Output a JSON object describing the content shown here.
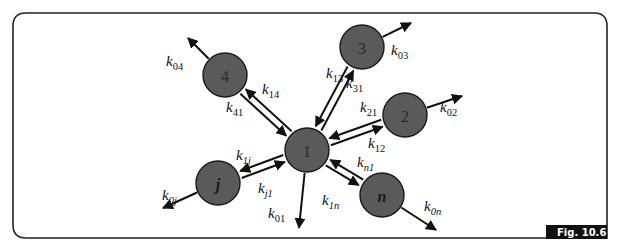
{
  "figure": {
    "label": "Fig. 10.6",
    "type": "compartmental model diagram"
  },
  "nodes": [
    {
      "id": "1",
      "label": "1",
      "italic": false
    },
    {
      "id": "2",
      "label": "2",
      "italic": false
    },
    {
      "id": "3",
      "label": "3",
      "italic": false
    },
    {
      "id": "4",
      "label": "4",
      "italic": false
    },
    {
      "id": "j",
      "label": "j",
      "italic": true
    },
    {
      "id": "n",
      "label": "n",
      "italic": true
    }
  ],
  "edges": [
    {
      "from": "1",
      "to": "2",
      "label": "k",
      "sub": "21"
    },
    {
      "from": "2",
      "to": "1",
      "label": "k",
      "sub": "12"
    },
    {
      "from": "1",
      "to": "3",
      "label": "k",
      "sub": "31"
    },
    {
      "from": "3",
      "to": "1",
      "label": "k",
      "sub": "13"
    },
    {
      "from": "1",
      "to": "4",
      "label": "k",
      "sub": "41"
    },
    {
      "from": "4",
      "to": "1",
      "label": "k",
      "sub": "14"
    },
    {
      "from": "1",
      "to": "j",
      "label": "k",
      "sub": "j1"
    },
    {
      "from": "j",
      "to": "1",
      "label": "k",
      "sub": "1j"
    },
    {
      "from": "1",
      "to": "n",
      "label": "k",
      "sub": "n1"
    },
    {
      "from": "n",
      "to": "1",
      "label": "k",
      "sub": "1n"
    }
  ],
  "outflows": [
    {
      "from": "1",
      "label": "k",
      "sub": "01"
    },
    {
      "from": "2",
      "label": "k",
      "sub": "02"
    },
    {
      "from": "3",
      "label": "k",
      "sub": "03"
    },
    {
      "from": "4",
      "label": "k",
      "sub": "04"
    },
    {
      "from": "j",
      "label": "k",
      "sub": "0j"
    },
    {
      "from": "n",
      "label": "k",
      "sub": "0n"
    }
  ]
}
